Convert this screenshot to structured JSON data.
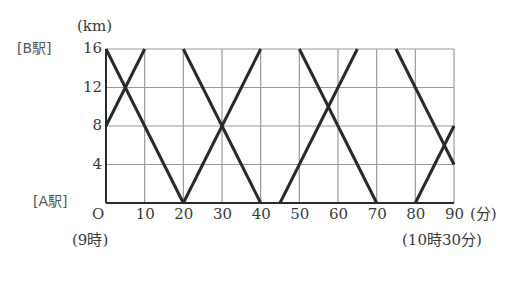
{
  "chart_data": {
    "type": "line",
    "title": "",
    "xlabel": "(分)",
    "ylabel": "(km)",
    "x_unit_label": "(分)",
    "y_unit_label": "(km)",
    "x_ticks": [
      0,
      10,
      20,
      30,
      40,
      50,
      60,
      70,
      80,
      90
    ],
    "x_tick_labels": [
      "O",
      "10",
      "20",
      "30",
      "40",
      "50",
      "60",
      "70",
      "80",
      "90"
    ],
    "y_ticks": [
      0,
      4,
      8,
      12,
      16
    ],
    "y_tick_labels": [
      "",
      "4",
      "8",
      "12",
      "16"
    ],
    "xlim": [
      0,
      90
    ],
    "ylim": [
      0,
      16
    ],
    "grid": true,
    "annotations": {
      "y_top_station": "[B駅]",
      "y_bottom_station": "[A駅]",
      "x_start_time": "(9時)",
      "x_end_time": "(10時30分)"
    },
    "series": [
      {
        "name": "segment-1",
        "points": [
          [
            0,
            8
          ],
          [
            10,
            16
          ]
        ]
      },
      {
        "name": "segment-2",
        "points": [
          [
            0,
            16
          ],
          [
            20,
            0
          ]
        ]
      },
      {
        "name": "segment-3",
        "points": [
          [
            20,
            0
          ],
          [
            40,
            16
          ]
        ]
      },
      {
        "name": "segment-4",
        "points": [
          [
            20,
            16
          ],
          [
            40,
            0
          ]
        ]
      },
      {
        "name": "segment-5",
        "points": [
          [
            45,
            0
          ],
          [
            65,
            16
          ]
        ]
      },
      {
        "name": "segment-6",
        "points": [
          [
            50,
            16
          ],
          [
            70,
            0
          ]
        ]
      },
      {
        "name": "segment-7",
        "points": [
          [
            75,
            16
          ],
          [
            90,
            4
          ]
        ]
      },
      {
        "name": "segment-8",
        "points": [
          [
            80,
            0
          ],
          [
            90,
            8
          ]
        ]
      }
    ],
    "colors": {
      "line": "#2a2a2a",
      "grid": "#9a9a9a",
      "axis": "#2a2a2a"
    }
  },
  "labels": {
    "km": "(km)",
    "b_station": "[B駅]",
    "a_station": "[A駅]",
    "origin": "O",
    "minutes": "(分)",
    "start_time": "(9時)",
    "end_time": "(10時30分)"
  }
}
